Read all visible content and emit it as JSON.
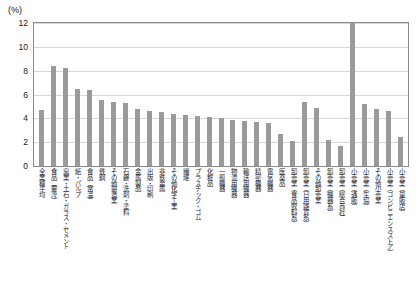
{
  "axis": {
    "unit_label": "(%)",
    "y_ticks": [
      "12",
      "10",
      "8",
      "6",
      "4",
      "2",
      "0"
    ]
  },
  "chart_data": {
    "type": "bar",
    "title": "",
    "subtitle": "",
    "xlabel": "",
    "ylabel": "(%)",
    "ylim": [
      0,
      12
    ],
    "yticks": [
      0,
      2,
      4,
      6,
      8,
      10,
      12
    ],
    "grid": true,
    "legend": "none",
    "bar_color": "#9a9a9a",
    "categories": [
      "全業種平均",
      "食品（要冷）",
      "窯業・土石・ガラス・セメント",
      "紙・パルプ",
      "食品（常温）",
      "鉄鋼",
      "その他製造業",
      "石鹸・洗剤・塗料",
      "金属製品",
      "出版・印刷",
      "非鉄金属",
      "その他化学工業",
      "繊維",
      "プラスチック・ゴム",
      "化粧品",
      "一般機器",
      "物流用機器",
      "輸送用機器",
      "精密機器",
      "電気機器",
      "医薬品",
      "卸売業（食品飲料系）",
      "卸売業（日用雑貨系）",
      "その他卸売業",
      "卸売業（機器系）",
      "卸売業（総合商社）",
      "小売業（通販）",
      "小売業（生協）",
      "その他小売業",
      "小売業（コンビニエンスストア）",
      "小売業（量販店）"
    ],
    "values": [
      4.7,
      8.4,
      8.2,
      6.5,
      6.4,
      5.5,
      5.4,
      5.3,
      4.8,
      4.6,
      4.5,
      4.4,
      4.3,
      4.2,
      4.1,
      4.0,
      3.9,
      3.8,
      3.7,
      3.6,
      2.7,
      2.1,
      5.4,
      4.9,
      2.2,
      1.7,
      12.0,
      5.2,
      4.8,
      4.6,
      2.4
    ]
  }
}
